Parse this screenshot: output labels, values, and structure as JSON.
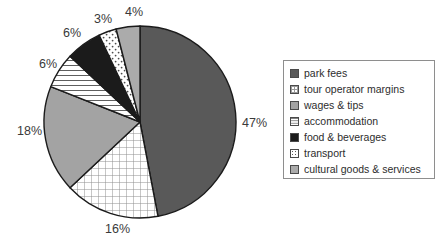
{
  "chart_data": {
    "type": "pie",
    "title": "",
    "subtitle": "",
    "xlabel": "",
    "ylabel": "",
    "grid": false,
    "legend_position": "right",
    "start_angle_deg": 0,
    "direction": "clockwise",
    "units": "percent",
    "categories": [
      "park fees",
      "tour operator margins",
      "wages & tips",
      "accommodation",
      "food & beverages",
      "transport",
      "cultural goods & services"
    ],
    "values": [
      47,
      16,
      18,
      6,
      6,
      3,
      4
    ],
    "value_labels": [
      "47%",
      "16%",
      "18%",
      "6%",
      "6%",
      "3%",
      "4%"
    ],
    "slices": [
      {
        "label": "park fees",
        "value": 47,
        "value_label": "47%",
        "pattern": "solid-dark",
        "color": "#595959",
        "swatch_class": "sw-solid-dark",
        "label_x": 242,
        "label_y": 116
      },
      {
        "label": "tour operator margins",
        "value": 16,
        "value_label": "16%",
        "pattern": "cross-hatch-grid",
        "color": "#ffffff",
        "swatch_class": "sw-grid",
        "label_x": 105,
        "label_y": 222
      },
      {
        "label": "wages & tips",
        "value": 18,
        "value_label": "18%",
        "pattern": "solid-mid-gray",
        "color": "#a3a3a3",
        "swatch_class": "sw-solid-mid",
        "label_x": 17,
        "label_y": 124
      },
      {
        "label": "accommodation",
        "value": 6,
        "value_label": "6%",
        "pattern": "horizontal-lines",
        "color": "#ffffff",
        "swatch_class": "sw-hlines",
        "label_x": 39,
        "label_y": 57
      },
      {
        "label": "food & beverages",
        "value": 6,
        "value_label": "6%",
        "pattern": "solid-black",
        "color": "#1b1b1b",
        "swatch_class": "sw-black",
        "label_x": 63,
        "label_y": 26
      },
      {
        "label": "transport",
        "value": 3,
        "value_label": "3%",
        "pattern": "dotted",
        "color": "#ffffff",
        "swatch_class": "sw-dots",
        "label_x": 94,
        "label_y": 12
      },
      {
        "label": "cultural goods & services",
        "value": 4,
        "value_label": "4%",
        "pattern": "solid-light-gray",
        "color": "#ababab",
        "swatch_class": "sw-solid-light",
        "label_x": 125,
        "label_y": 5
      }
    ],
    "geometry": {
      "center_x": 140,
      "center_y": 122,
      "radius": 96,
      "stroke": "#1b1b1b",
      "stroke_width": 1.4
    }
  },
  "legend": {
    "border_color": "#8e8e8e",
    "items": [
      {
        "label": "park fees",
        "swatch_class": "sw-solid-dark"
      },
      {
        "label": "tour operator margins",
        "swatch_class": "sw-grid"
      },
      {
        "label": "wages & tips",
        "swatch_class": "sw-solid-mid"
      },
      {
        "label": "accommodation",
        "swatch_class": "sw-hlines"
      },
      {
        "label": "food & beverages",
        "swatch_class": "sw-black"
      },
      {
        "label": "transport",
        "swatch_class": "sw-dots"
      },
      {
        "label": "cultural goods & services",
        "swatch_class": "sw-solid-light"
      }
    ]
  }
}
